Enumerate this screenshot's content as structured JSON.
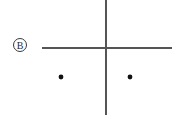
{
  "figure": {
    "name": "panel-b-crosshair-diagram",
    "width": 182,
    "height": 115,
    "background_color": "#ffffff",
    "panel_label": {
      "text": "B",
      "style": "circled",
      "center_x": 20,
      "center_y": 45,
      "radius": 6.5,
      "stroke_color": "#3a3a3a",
      "text_color": "#2b2b2b",
      "font_size": 10
    },
    "axes": {
      "stroke_color": "#555555",
      "stroke_width": 2,
      "vertical": {
        "name": "vertical-axis-line",
        "x": 106,
        "y1": 0,
        "y2": 115
      },
      "horizontal": {
        "name": "horizontal-axis-line",
        "y": 48,
        "x1": 42,
        "x2": 172
      },
      "intersection": {
        "x": 106,
        "y": 48
      }
    },
    "points": [
      {
        "name": "point-left",
        "cx": 61,
        "cy": 77,
        "r": 2.4,
        "color": "#111111"
      },
      {
        "name": "point-right",
        "cx": 130,
        "cy": 77,
        "r": 2.4,
        "color": "#111111"
      }
    ]
  }
}
